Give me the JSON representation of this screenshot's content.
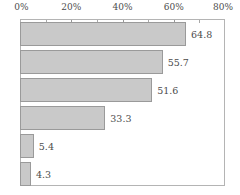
{
  "chart_data": {
    "type": "bar",
    "orientation": "horizontal",
    "title": "",
    "xlabel": "",
    "ylabel": "",
    "xlim": [
      0,
      80
    ],
    "grid": false,
    "legend": null,
    "axis_position": "top",
    "tick_labels": [
      "0%",
      "20%",
      "40%",
      "60%",
      "80%"
    ],
    "tick_values": [
      0,
      20,
      40,
      60,
      80
    ],
    "minor_tick_values": [
      10,
      30,
      50,
      70
    ],
    "categories": [
      "",
      "",
      "",
      "",
      "",
      ""
    ],
    "values": [
      64.8,
      55.7,
      51.6,
      33.3,
      5.4,
      4.3
    ],
    "value_labels": [
      "64.8",
      "55.7",
      "51.6",
      "33.3",
      "5.4",
      "4.3"
    ],
    "bar_fill_color": "#c9c9c9",
    "bar_border_color": "#9a9a9a",
    "axis_color": "#b4b4b4",
    "text_color": "#4c4c4c"
  }
}
